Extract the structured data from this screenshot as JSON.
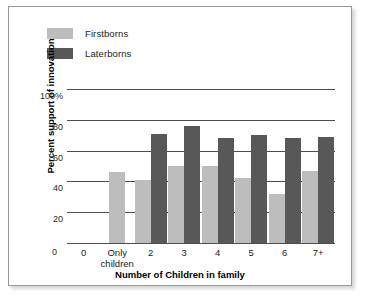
{
  "chart_data": {
    "type": "bar",
    "title": "",
    "subtitle": "",
    "xlabel": "Number of Children in family",
    "ylabel": "Percent support of innovation",
    "categories": [
      "0",
      "Only\nchildren",
      "2",
      "3",
      "4",
      "5",
      "6",
      "7+"
    ],
    "series": [
      {
        "name": "Firstborns",
        "color": "#bdbdbd",
        "values": [
          null,
          46,
          41,
          50,
          50,
          42,
          32,
          47
        ]
      },
      {
        "name": "Laterborns",
        "color": "#585858",
        "values": [
          null,
          null,
          71,
          76,
          68,
          70,
          68,
          69
        ]
      }
    ],
    "ylim": [
      0,
      100
    ],
    "yticks": [
      "20",
      "40",
      "60",
      "80",
      "100%"
    ],
    "ytick_values": [
      20,
      40,
      60,
      80,
      100
    ],
    "grid": true,
    "legend_position": "top-left",
    "annotations": []
  },
  "legend": {
    "items": [
      {
        "label": "Firstborns",
        "color": "#bdbdbd"
      },
      {
        "label": "Laterborns",
        "color": "#585858"
      }
    ]
  },
  "axes": {
    "y_zero_label": "0",
    "x_title": "Number of Children in family",
    "y_title": "Percent support of innovation"
  },
  "colors": {
    "firstborns": "#bdbdbd",
    "laterborns": "#585858",
    "gridline": "#4d4d4d",
    "frame": "#9a9a9a",
    "background": "#ffffff"
  }
}
